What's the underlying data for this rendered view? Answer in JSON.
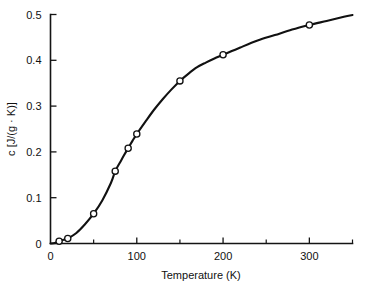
{
  "chart_data": {
    "type": "line",
    "title": "",
    "xlabel": "Temperature (K)",
    "ylabel": "c [J/(g · K)]",
    "xlim": [
      0,
      350
    ],
    "ylim": [
      0,
      0.5
    ],
    "grid": false,
    "legend": "none",
    "x": [
      10,
      20,
      50,
      75,
      90,
      100,
      150,
      200,
      300
    ],
    "values": [
      0.005,
      0.011,
      0.065,
      0.158,
      0.208,
      0.239,
      0.355,
      0.412,
      0.477
    ],
    "series": [
      {
        "name": "specific heat",
        "x": [
          10,
          20,
          50,
          75,
          90,
          100,
          150,
          200,
          300
        ],
        "values": [
          0.005,
          0.011,
          0.065,
          0.158,
          0.208,
          0.239,
          0.355,
          0.412,
          0.477
        ]
      }
    ],
    "curve_points": [
      [
        0,
        0.0
      ],
      [
        5,
        0.001
      ],
      [
        10,
        0.005
      ],
      [
        15,
        0.008
      ],
      [
        20,
        0.011
      ],
      [
        30,
        0.023
      ],
      [
        40,
        0.042
      ],
      [
        50,
        0.065
      ],
      [
        60,
        0.094
      ],
      [
        70,
        0.132
      ],
      [
        75,
        0.158
      ],
      [
        80,
        0.175
      ],
      [
        85,
        0.192
      ],
      [
        90,
        0.208
      ],
      [
        95,
        0.224
      ],
      [
        100,
        0.239
      ],
      [
        110,
        0.266
      ],
      [
        120,
        0.292
      ],
      [
        130,
        0.315
      ],
      [
        140,
        0.336
      ],
      [
        150,
        0.355
      ],
      [
        160,
        0.371
      ],
      [
        170,
        0.385
      ],
      [
        180,
        0.395
      ],
      [
        190,
        0.404
      ],
      [
        200,
        0.412
      ],
      [
        220,
        0.428
      ],
      [
        240,
        0.443
      ],
      [
        260,
        0.455
      ],
      [
        280,
        0.467
      ],
      [
        300,
        0.477
      ],
      [
        320,
        0.486
      ],
      [
        340,
        0.495
      ],
      [
        350,
        0.499
      ]
    ],
    "x_ticks_major": [
      {
        "value": 0,
        "label": "0"
      },
      {
        "value": 100,
        "label": "100"
      },
      {
        "value": 200,
        "label": "200"
      },
      {
        "value": 300,
        "label": "300"
      }
    ],
    "x_ticks_minor": [
      50,
      150,
      250,
      350
    ],
    "y_ticks_major": [
      {
        "value": 0,
        "label": "0"
      },
      {
        "value": 0.1,
        "label": "0.1"
      },
      {
        "value": 0.2,
        "label": "0.2"
      },
      {
        "value": 0.3,
        "label": "0.3"
      },
      {
        "value": 0.4,
        "label": "0.4"
      },
      {
        "value": 0.5,
        "label": "0.5"
      }
    ],
    "colors": {
      "curve": "#111111",
      "axis": "#141414",
      "marker_fill": "#ffffff",
      "background": "#ffffff"
    }
  }
}
